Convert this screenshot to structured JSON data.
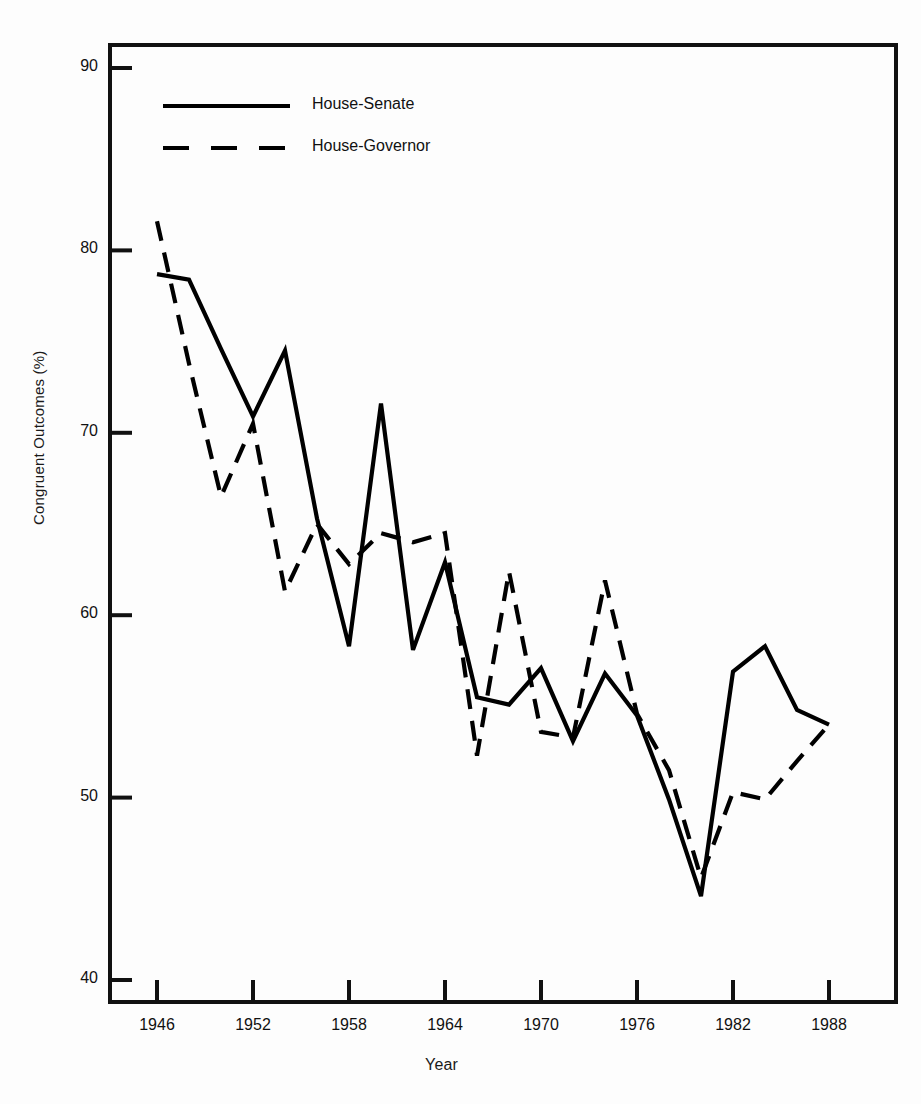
{
  "chart_data": {
    "type": "line",
    "title": "",
    "xlabel": "Year",
    "ylabel": "Congruent Outcomes (%)",
    "xlim": [
      1945,
      1990
    ],
    "ylim": [
      40,
      90
    ],
    "grid": false,
    "legend_position": "top-left-inside",
    "xticks": [
      "1946",
      "1952",
      "1958",
      "1964",
      "1970",
      "1976",
      "1982",
      "1988"
    ],
    "xtick_values": [
      1946,
      1952,
      1958,
      1964,
      1970,
      1976,
      1982,
      1988
    ],
    "yticks": [
      "40",
      "50",
      "60",
      "70",
      "80",
      "90"
    ],
    "ytick_values": [
      40,
      50,
      60,
      70,
      80,
      90
    ],
    "x": [
      1946,
      1948,
      1950,
      1952,
      1954,
      1956,
      1958,
      1960,
      1962,
      1964,
      1966,
      1968,
      1970,
      1972,
      1974,
      1976,
      1978,
      1980,
      1982,
      1984,
      1986,
      1988
    ],
    "series": [
      {
        "name": "House-Senate",
        "style": "solid",
        "color": "#000000",
        "values": [
          78.7,
          78.4,
          74.6,
          70.9,
          74.5,
          65.3,
          58.3,
          71.6,
          58.1,
          62.9,
          55.5,
          55.1,
          57.1,
          53.1,
          56.8,
          54.5,
          49.9,
          44.6,
          56.9,
          58.3,
          54.8,
          54.0
        ]
      },
      {
        "name": "House-Governor",
        "style": "dashed",
        "color": "#000000",
        "values": [
          81.6,
          73.8,
          66.5,
          70.5,
          61.3,
          65.0,
          62.8,
          64.5,
          64.0,
          64.5,
          52.3,
          62.4,
          53.6,
          53.3,
          61.9,
          54.6,
          51.5,
          45.6,
          50.3,
          49.9,
          52.0,
          54.0
        ]
      }
    ]
  },
  "legend": {
    "items": [
      {
        "label": "House-Senate",
        "style": "solid"
      },
      {
        "label": "House-Governor",
        "style": "dashed"
      }
    ]
  }
}
